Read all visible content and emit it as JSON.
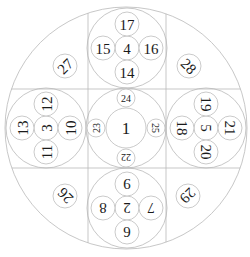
{
  "diagram": {
    "line_color": "#b9b9b9",
    "text_color": "#1a1a1a",
    "outer_circle": {
      "cx": 126,
      "cy": 128,
      "r": 121
    },
    "grid_lines": {
      "vertical_x": [
        88,
        166
      ],
      "horizontal_y": [
        89,
        168
      ]
    },
    "groups": [
      {
        "name": "center",
        "cx": 126,
        "cy": 128,
        "r": 40,
        "center_number": {
          "label": "1",
          "r": 20,
          "size": 17,
          "rotate": 0
        },
        "satellites": [
          {
            "label": "24",
            "dx": 0,
            "dy": -30,
            "r": 9,
            "size": 10,
            "rotate": 0
          },
          {
            "label": "25",
            "dx": 30,
            "dy": 0,
            "r": 9,
            "size": 10,
            "rotate": 90
          },
          {
            "label": "22",
            "dx": 0,
            "dy": 30,
            "r": 9,
            "size": 10,
            "rotate": 180
          },
          {
            "label": "23",
            "dx": -30,
            "dy": 0,
            "r": 9,
            "size": 10,
            "rotate": -90
          }
        ]
      },
      {
        "name": "top",
        "cx": 127,
        "cy": 48,
        "r": 40,
        "center_number": {
          "label": "4",
          "r": 12,
          "size": 15,
          "rotate": 0
        },
        "satellites": [
          {
            "label": "17",
            "dx": 0,
            "dy": -24,
            "r": 12,
            "size": 15,
            "rotate": 0
          },
          {
            "label": "16",
            "dx": 24,
            "dy": 0,
            "r": 12,
            "size": 15,
            "rotate": 0
          },
          {
            "label": "14",
            "dx": 0,
            "dy": 24,
            "r": 12,
            "size": 15,
            "rotate": 0
          },
          {
            "label": "15",
            "dx": -24,
            "dy": 0,
            "r": 12,
            "size": 15,
            "rotate": 0
          }
        ]
      },
      {
        "name": "left",
        "cx": 46,
        "cy": 128,
        "r": 40,
        "center_number": {
          "label": "3",
          "r": 12,
          "size": 15,
          "rotate": -90
        },
        "satellites": [
          {
            "label": "12",
            "dx": 0,
            "dy": -24,
            "r": 12,
            "size": 15,
            "rotate": -90
          },
          {
            "label": "10",
            "dx": 24,
            "dy": 0,
            "r": 12,
            "size": 15,
            "rotate": -90
          },
          {
            "label": "11",
            "dx": 0,
            "dy": 24,
            "r": 12,
            "size": 15,
            "rotate": -90
          },
          {
            "label": "13",
            "dx": -24,
            "dy": 0,
            "r": 12,
            "size": 15,
            "rotate": -90
          }
        ]
      },
      {
        "name": "right",
        "cx": 206,
        "cy": 128,
        "r": 40,
        "center_number": {
          "label": "5",
          "r": 12,
          "size": 15,
          "rotate": 90
        },
        "satellites": [
          {
            "label": "19",
            "dx": 0,
            "dy": -24,
            "r": 12,
            "size": 15,
            "rotate": 90
          },
          {
            "label": "21",
            "dx": 24,
            "dy": 0,
            "r": 12,
            "size": 15,
            "rotate": 90
          },
          {
            "label": "20",
            "dx": 0,
            "dy": 24,
            "r": 12,
            "size": 15,
            "rotate": 90
          },
          {
            "label": "18",
            "dx": -24,
            "dy": 0,
            "r": 12,
            "size": 15,
            "rotate": 90
          }
        ]
      },
      {
        "name": "bottom",
        "cx": 127,
        "cy": 208,
        "r": 40,
        "center_number": {
          "label": "2",
          "r": 12,
          "size": 15,
          "rotate": 180
        },
        "satellites": [
          {
            "label": "9",
            "dx": 0,
            "dy": -24,
            "r": 12,
            "size": 15,
            "rotate": 180
          },
          {
            "label": "7",
            "dx": 24,
            "dy": 0,
            "r": 12,
            "size": 15,
            "rotate": 180
          },
          {
            "label": "6",
            "dx": 0,
            "dy": 24,
            "r": 12,
            "size": 15,
            "rotate": 180
          },
          {
            "label": "8",
            "dx": -24,
            "dy": 0,
            "r": 12,
            "size": 15,
            "rotate": 180
          }
        ]
      }
    ],
    "corners": [
      {
        "name": "top-left",
        "label": "27",
        "cx": 65,
        "cy": 66,
        "r": 12,
        "size": 15,
        "rotate": -45
      },
      {
        "name": "top-right",
        "label": "28",
        "cx": 189,
        "cy": 66,
        "r": 12,
        "size": 15,
        "rotate": 45
      },
      {
        "name": "bottom-left",
        "label": "26",
        "cx": 65,
        "cy": 196,
        "r": 12,
        "size": 15,
        "rotate": -135
      },
      {
        "name": "bottom-right",
        "label": "29",
        "cx": 188,
        "cy": 196,
        "r": 12,
        "size": 15,
        "rotate": 135
      }
    ]
  }
}
